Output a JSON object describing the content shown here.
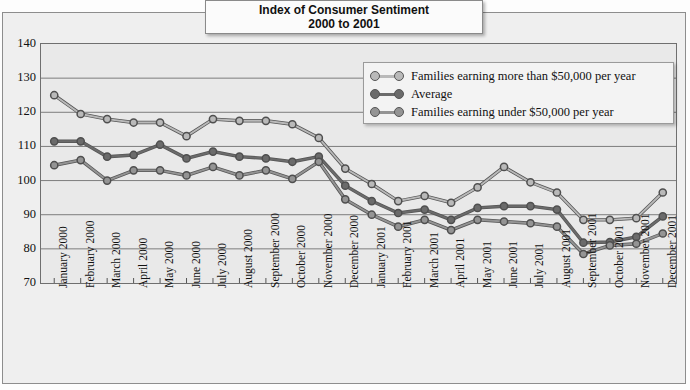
{
  "title": {
    "line1": "Index of Consumer Sentiment",
    "line2": "2000 to 2001"
  },
  "legend": {
    "items": [
      {
        "label": "Families earning more than $50,000 per year",
        "color": "#b9b9b9"
      },
      {
        "label": "Average",
        "color": "#6b6b6b"
      },
      {
        "label": "Families earning under $50,000 per year",
        "color": "#949494"
      }
    ]
  },
  "chart_data": {
    "type": "line",
    "title": "Index of Consumer Sentiment 2000 to 2001",
    "xlabel": "",
    "ylabel": "",
    "ylim": [
      70,
      140
    ],
    "yticks": [
      140,
      130,
      120,
      110,
      100,
      90,
      80,
      70
    ],
    "grid": true,
    "legend_position": "upper-right-inside",
    "categories": [
      "January 2000",
      "February 2000",
      "March 2000",
      "April 2000",
      "May 2000",
      "June 2000",
      "July 2000",
      "August 2000",
      "September 2000",
      "October 2000",
      "November 2000",
      "December 2000",
      "January 2001",
      "February 2001",
      "March 2001",
      "April 2001",
      "May 2001",
      "June 2001",
      "July 2001",
      "August 2001",
      "September 2001",
      "October 2001",
      "November 2001",
      "December 2001"
    ],
    "series": [
      {
        "name": "Families earning more than $50,000 per year",
        "color": "#b9b9b9",
        "values": [
          125.0,
          119.5,
          118.0,
          117.0,
          117.0,
          113.0,
          118.0,
          117.5,
          117.5,
          116.5,
          112.5,
          103.5,
          99.0,
          94.0,
          95.5,
          93.5,
          98.0,
          104.0,
          99.5,
          96.5,
          88.5,
          88.5,
          89.0,
          96.5
        ]
      },
      {
        "name": "Average",
        "color": "#6b6b6b",
        "values": [
          111.5,
          111.5,
          107.0,
          107.5,
          110.5,
          106.5,
          108.5,
          107.0,
          106.5,
          105.5,
          107.0,
          98.5,
          94.0,
          90.5,
          91.5,
          88.5,
          92.0,
          92.5,
          92.5,
          91.5,
          81.8,
          82.0,
          83.5,
          89.5
        ]
      },
      {
        "name": "Families earning under $50,000 per year",
        "color": "#949494",
        "values": [
          104.5,
          106.0,
          100.0,
          103.0,
          103.0,
          101.5,
          104.0,
          101.5,
          103.0,
          100.5,
          105.5,
          94.5,
          90.0,
          86.5,
          88.5,
          85.5,
          88.5,
          88.0,
          87.5,
          86.5,
          78.5,
          81.0,
          81.5,
          84.5
        ]
      }
    ]
  }
}
